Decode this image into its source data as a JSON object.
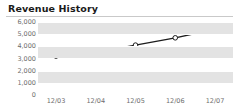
{
  "panel": {
    "title": "Revenue History"
  },
  "chart_data": {
    "type": "line",
    "title": "Revenue History",
    "xlabel": "",
    "ylabel": "",
    "categories": [
      "12/03",
      "12/04",
      "12/05",
      "12/06",
      "12/07"
    ],
    "values": [
      3200,
      3500,
      4100,
      4700,
      5400
    ],
    "series": [
      {
        "name": "Revenue",
        "values": [
          3200,
          3500,
          4100,
          4700,
          5400
        ]
      }
    ],
    "ylim": [
      0,
      6000
    ],
    "ytick_labels": [
      "6,000",
      "5,000",
      "4,000",
      "3,000",
      "2,000",
      "1,000",
      "0"
    ],
    "yticks": [
      6000,
      5000,
      4000,
      3000,
      2000,
      1000,
      0
    ],
    "grid": true,
    "legend": "none",
    "marker": "open-circle",
    "line_color": "#1c1c1c",
    "marker_fill": "#ffffff",
    "band_color": "#e3e3e3",
    "plot_background": "#ffffff",
    "tick_text_color": "#6e6e6e",
    "title_color": "#1a1a1a",
    "rule_color": "#c9c9c9"
  }
}
